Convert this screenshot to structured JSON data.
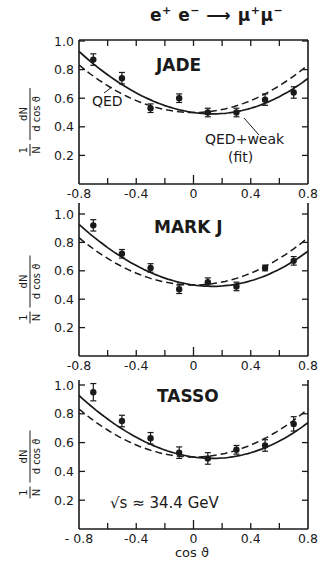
{
  "title": {
    "process": "e⁺e⁻ ⟶ μ⁺μ⁻",
    "parts": [
      "e",
      "+",
      " e",
      "−",
      " ⟶ ",
      "μ",
      "+",
      "μ",
      "−"
    ]
  },
  "colors": {
    "ink": "#1a1a1a",
    "background": "#ffffff"
  },
  "chart_data": [
    {
      "type": "scatter",
      "panel": "JADE",
      "title": "JADE",
      "xlabel": "",
      "ylabel": "1/N dN/d cosϑ",
      "xlim": [
        -0.8,
        0.8
      ],
      "ylim": [
        0,
        1.0
      ],
      "xticks": [
        -0.8,
        -0.4,
        0,
        0.4,
        0.8
      ],
      "xtick_labels": [
        "-0.8",
        "-0.4",
        "0",
        "0.4",
        "0.8"
      ],
      "yticks": [
        0.2,
        0.4,
        0.6,
        0.8,
        1.0
      ],
      "ytick_labels": [
        "0.2",
        "0.4",
        "0.6",
        "0.8",
        "1.0"
      ],
      "grid": false,
      "series": [
        {
          "name": "data",
          "style": "points-with-errorbars",
          "x": [
            -0.7,
            -0.5,
            -0.3,
            -0.1,
            0.1,
            0.3,
            0.5,
            0.7
          ],
          "y": [
            0.87,
            0.74,
            0.53,
            0.6,
            0.5,
            0.5,
            0.59,
            0.64
          ],
          "yerr": [
            0.04,
            0.04,
            0.03,
            0.03,
            0.03,
            0.03,
            0.04,
            0.04
          ]
        },
        {
          "name": "QED",
          "style": "dashed",
          "formula": "0.375*(1+x^2)*1.333"
        },
        {
          "name": "QED+weak (fit)",
          "style": "solid",
          "formula": "QED with forward-backward asymmetry"
        }
      ],
      "annotations": [
        "QED",
        "QED+weak",
        "(fit)"
      ]
    },
    {
      "type": "scatter",
      "panel": "MARK J",
      "title": "MARK J",
      "xlabel": "",
      "ylabel": "1/N dN/d cosϑ",
      "xlim": [
        -0.8,
        0.8
      ],
      "ylim": [
        0,
        1.0
      ],
      "xticks": [
        -0.8,
        -0.4,
        0,
        0.4,
        0.8
      ],
      "xtick_labels": [
        "-0.8",
        "-0.4",
        "0",
        "0.4",
        "0.8"
      ],
      "yticks": [
        0.2,
        0.4,
        0.6,
        0.8,
        1.0
      ],
      "ytick_labels": [
        "0.2",
        "0.4",
        "0.6",
        "0.8",
        "1.0"
      ],
      "grid": false,
      "series": [
        {
          "name": "data",
          "style": "points-with-errorbars",
          "x": [
            -0.7,
            -0.5,
            -0.3,
            -0.1,
            0.1,
            0.3,
            0.5,
            0.7
          ],
          "y": [
            0.92,
            0.72,
            0.62,
            0.47,
            0.52,
            0.49,
            0.62,
            0.67
          ],
          "yerr": [
            0.04,
            0.03,
            0.03,
            0.03,
            0.03,
            0.03,
            0.02,
            0.03
          ]
        },
        {
          "name": "QED",
          "style": "dashed"
        },
        {
          "name": "QED+weak (fit)",
          "style": "solid"
        }
      ]
    },
    {
      "type": "scatter",
      "panel": "TASSO",
      "title": "TASSO",
      "xlabel": "cos ϑ",
      "ylabel": "1/N dN/d cosϑ",
      "xlim": [
        -0.8,
        0.8
      ],
      "ylim": [
        0,
        1.0
      ],
      "xticks": [
        -0.8,
        -0.4,
        0,
        0.4,
        0.8
      ],
      "xtick_labels": [
        "- 0.8",
        "-0.4",
        "0",
        "0.4",
        "0.8"
      ],
      "yticks": [
        0.2,
        0.4,
        0.6,
        0.8,
        1.0
      ],
      "ytick_labels": [
        "0.2",
        "0.4",
        "0.6",
        "0.8",
        "1.0"
      ],
      "grid": false,
      "series": [
        {
          "name": "data",
          "style": "points-with-errorbars",
          "x": [
            -0.7,
            -0.5,
            -0.3,
            -0.1,
            0.1,
            0.3,
            0.5,
            0.7
          ],
          "y": [
            0.95,
            0.75,
            0.63,
            0.53,
            0.49,
            0.55,
            0.58,
            0.73
          ],
          "yerr": [
            0.06,
            0.04,
            0.04,
            0.04,
            0.04,
            0.03,
            0.04,
            0.05
          ]
        },
        {
          "name": "QED",
          "style": "dashed"
        },
        {
          "name": "QED+weak (fit)",
          "style": "solid"
        }
      ],
      "annotations": [
        "√s ≈ 34.4 GeV"
      ]
    }
  ],
  "labels": {
    "ylabel_num_top": "1",
    "ylabel_num_bot": "N",
    "ylabel_den_top": "dN",
    "ylabel_den_bot": "d cos ϑ",
    "xlabel": "cos ϑ",
    "qed": "QED",
    "qed_weak": "QED+weak",
    "fit": "(fit)",
    "energy": "√s ≈ 34.4 GeV"
  }
}
